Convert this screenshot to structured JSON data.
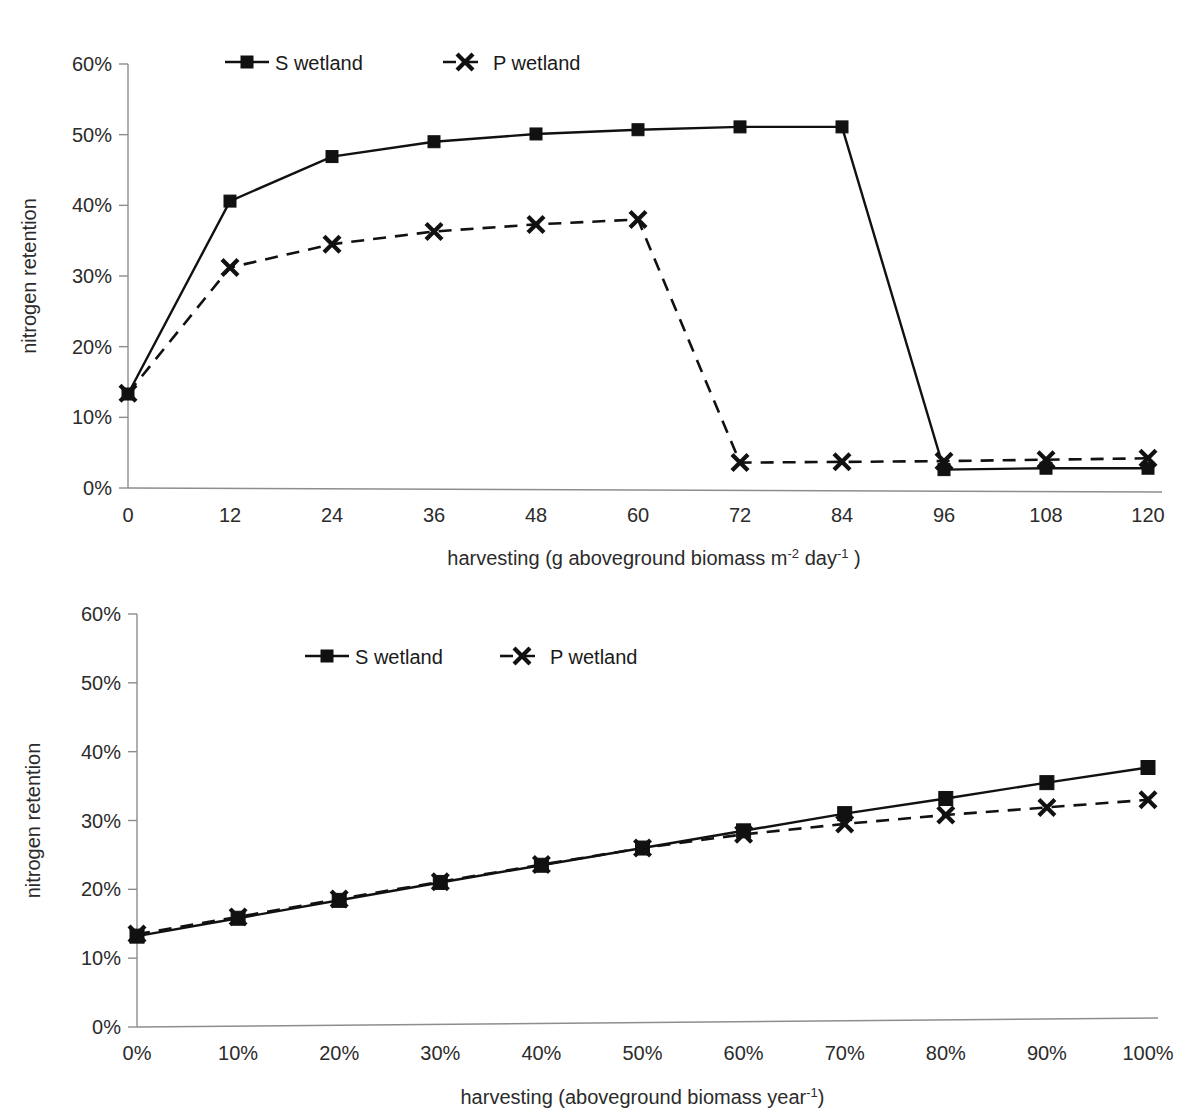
{
  "figure": {
    "background": "#ffffff",
    "ink_color": "#111111",
    "axis_color": "#8d8d8d",
    "width": 1198,
    "height": 1115
  },
  "charts": [
    {
      "id": "top",
      "ylabel": "nitrogen retention",
      "xlabel_parts": {
        "a": "harvesting (g aboveground biomass m",
        "sup1": "-2",
        "b": " day",
        "sup2": "-1",
        "c": " )"
      },
      "xlabel_plain": "harvesting (g aboveground biomass m-2 day-1 )",
      "legend": [
        {
          "label": "S wetland",
          "marker": "square",
          "line": "solid"
        },
        {
          "label": "P wetland",
          "marker": "cross",
          "line": "dashed"
        }
      ],
      "yticks": [
        "0%",
        "10%",
        "20%",
        "30%",
        "40%",
        "50%",
        "60%"
      ],
      "xticks": [
        "0",
        "12",
        "24",
        "36",
        "48",
        "60",
        "72",
        "84",
        "96",
        "108",
        "120"
      ]
    },
    {
      "id": "bottom",
      "ylabel": "nitrogen retention",
      "xlabel_parts": {
        "a": "harvesting (aboveground biomass year",
        "sup1": "-1",
        "c": ")"
      },
      "xlabel_plain": "harvesting (aboveground biomass year-1)",
      "legend": [
        {
          "label": "S wetland",
          "marker": "square",
          "line": "solid"
        },
        {
          "label": "P wetland",
          "marker": "cross",
          "line": "dashed"
        }
      ],
      "yticks": [
        "0%",
        "10%",
        "20%",
        "30%",
        "40%",
        "50%",
        "60%"
      ],
      "xticks": [
        "0%",
        "10%",
        "20%",
        "30%",
        "40%",
        "50%",
        "60%",
        "70%",
        "80%",
        "90%",
        "100%"
      ]
    }
  ],
  "chart_data": [
    {
      "type": "line",
      "id": "top-panel",
      "title": "",
      "xlabel": "harvesting (g aboveground biomass m-2 day-1 )",
      "ylabel": "nitrogen retention",
      "x": [
        0,
        12,
        24,
        36,
        48,
        60,
        72,
        84,
        96,
        108,
        120
      ],
      "xlim": [
        0,
        120
      ],
      "ylim": [
        0,
        60
      ],
      "yticks": [
        0,
        10,
        20,
        30,
        40,
        50,
        60
      ],
      "ytick_labels": [
        "0%",
        "10%",
        "20%",
        "30%",
        "40%",
        "50%",
        "60%"
      ],
      "xtick_labels": [
        "0",
        "12",
        "24",
        "36",
        "48",
        "60",
        "72",
        "84",
        "96",
        "108",
        "120"
      ],
      "grid": false,
      "legend_position": "top-center",
      "series": [
        {
          "name": "S wetland",
          "line_style": "solid",
          "marker": "square",
          "values": [
            13.3,
            40.6,
            46.9,
            49.0,
            50.1,
            50.7,
            51.1,
            51.1,
            2.6,
            2.8,
            2.8
          ]
        },
        {
          "name": "P wetland",
          "line_style": "dashed",
          "marker": "cross",
          "values": [
            13.4,
            31.2,
            34.5,
            36.3,
            37.3,
            38.0,
            3.6,
            3.7,
            3.8,
            4.0,
            4.2
          ]
        }
      ]
    },
    {
      "type": "line",
      "id": "bottom-panel",
      "title": "",
      "xlabel": "harvesting (aboveground biomass year-1)",
      "ylabel": "nitrogen retention",
      "x": [
        0,
        10,
        20,
        30,
        40,
        50,
        60,
        70,
        80,
        90,
        100
      ],
      "xlim": [
        0,
        100
      ],
      "ylim": [
        0,
        60
      ],
      "yticks": [
        0,
        10,
        20,
        30,
        40,
        50,
        60
      ],
      "ytick_labels": [
        "0%",
        "10%",
        "20%",
        "30%",
        "40%",
        "50%",
        "60%"
      ],
      "xtick_labels": [
        "0%",
        "10%",
        "20%",
        "30%",
        "40%",
        "50%",
        "60%",
        "70%",
        "80%",
        "90%",
        "100%"
      ],
      "grid": false,
      "legend_position": "top-center",
      "series": [
        {
          "name": "S wetland",
          "line_style": "solid",
          "marker": "square",
          "values": [
            13.2,
            15.8,
            18.4,
            21.0,
            23.5,
            26.0,
            28.5,
            31.0,
            33.2,
            35.5,
            37.7
          ]
        },
        {
          "name": "P wetland",
          "line_style": "dashed",
          "marker": "cross",
          "values": [
            13.5,
            16.0,
            18.6,
            21.1,
            23.6,
            26.0,
            28.0,
            29.5,
            30.8,
            31.9,
            33.0
          ]
        }
      ]
    }
  ]
}
